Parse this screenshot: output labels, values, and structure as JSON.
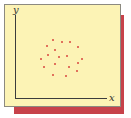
{
  "chart_data": {
    "type": "scatter",
    "title": "",
    "xlabel": "x",
    "ylabel": "y",
    "grid": false,
    "legend": null,
    "xlim": [
      0,
      100
    ],
    "ylim": [
      0,
      100
    ],
    "points": [
      {
        "x": 41,
        "y": 70
      },
      {
        "x": 51,
        "y": 67
      },
      {
        "x": 60,
        "y": 67
      },
      {
        "x": 35,
        "y": 63
      },
      {
        "x": 69,
        "y": 61
      },
      {
        "x": 43,
        "y": 58
      },
      {
        "x": 36,
        "y": 52
      },
      {
        "x": 56,
        "y": 51
      },
      {
        "x": 48,
        "y": 50
      },
      {
        "x": 28,
        "y": 47
      },
      {
        "x": 73,
        "y": 47
      },
      {
        "x": 43,
        "y": 41
      },
      {
        "x": 68,
        "y": 42
      },
      {
        "x": 32,
        "y": 37
      },
      {
        "x": 59,
        "y": 37
      },
      {
        "x": 67,
        "y": 33
      },
      {
        "x": 41,
        "y": 28
      },
      {
        "x": 55,
        "y": 27
      }
    ],
    "colors": {
      "points": "#d9473f",
      "card": "#fcf3b5",
      "shadow": "#c7424a",
      "axes": "#3c3c3c"
    }
  },
  "axes": {
    "x_label": "x",
    "y_label": "y"
  }
}
